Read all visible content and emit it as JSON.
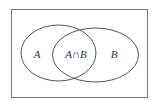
{
  "diagram": {
    "type": "venn",
    "universe": {
      "label": ""
    },
    "sets": [
      {
        "name": "A",
        "label": "A"
      },
      {
        "name": "B",
        "label": "B"
      }
    ],
    "intersection": {
      "label": "A∩B"
    },
    "colors": {
      "stroke": "#555555",
      "background": "#ffffff"
    }
  }
}
